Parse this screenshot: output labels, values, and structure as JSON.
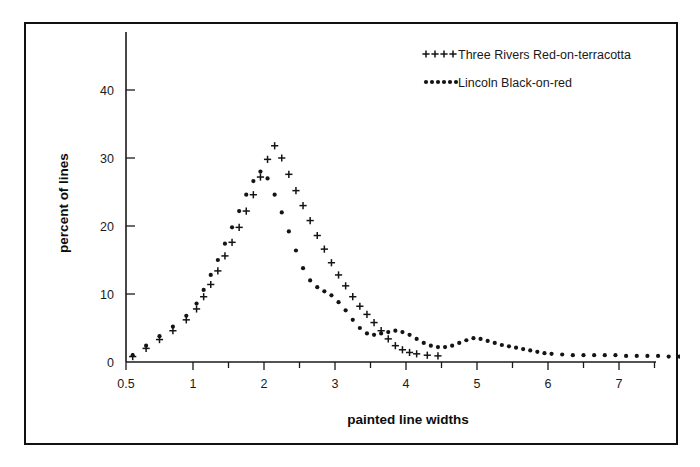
{
  "figure": {
    "border_color": "#111111",
    "background": "#ffffff"
  },
  "chart_data": {
    "type": "line",
    "title": "",
    "xlabel": "painted line widths",
    "ylabel": "percent of lines",
    "xlim": [
      0.4,
      8.25
    ],
    "ylim": [
      0,
      45
    ],
    "grid": false,
    "legend_position": "top-right",
    "x_ticks_major": [
      0.5,
      1,
      2,
      3,
      4,
      5,
      6,
      7,
      8
    ],
    "x_tick_labels": [
      "0.5",
      "1",
      "2",
      "3",
      "4",
      "5",
      "6",
      "7",
      "8"
    ],
    "x_ticks_minor": [
      1.5,
      2.5,
      3.5,
      4.5,
      5.5,
      6.5,
      7.5
    ],
    "y_ticks_major": [
      0,
      10,
      20,
      30,
      40
    ],
    "y_tick_labels": [
      "0",
      "10",
      "20",
      "30",
      "40"
    ],
    "series": [
      {
        "name": "Three Rivers Red-on-terracotta",
        "marker": "plus",
        "marker_color": "#141414",
        "x": [
          0.55,
          0.65,
          0.75,
          0.85,
          0.95,
          1.05,
          1.15,
          1.25,
          1.35,
          1.45,
          1.55,
          1.65,
          1.75,
          1.85,
          1.95,
          2.05,
          2.15,
          2.25,
          2.35,
          2.45,
          2.55,
          2.65,
          2.75,
          2.85,
          2.95,
          3.05,
          3.15,
          3.25,
          3.35,
          3.45,
          3.55,
          3.65,
          3.75,
          3.85,
          3.95,
          4.05,
          4.15,
          4.3,
          4.45
        ],
        "y": [
          0.8,
          2.0,
          3.3,
          4.6,
          6.2,
          7.8,
          9.6,
          11.4,
          13.4,
          15.6,
          17.6,
          19.8,
          22.2,
          24.6,
          27.2,
          29.8,
          31.8,
          30.0,
          27.6,
          25.2,
          23.0,
          20.8,
          18.6,
          16.6,
          14.6,
          12.8,
          11.2,
          9.6,
          8.2,
          7.0,
          5.8,
          4.6,
          3.4,
          2.4,
          1.8,
          1.4,
          1.2,
          1.0,
          0.9
        ]
      },
      {
        "name": "Lincoln Black-on-red",
        "marker": "dot",
        "marker_color": "#141414",
        "x": [
          0.55,
          0.65,
          0.75,
          0.85,
          0.95,
          1.05,
          1.15,
          1.25,
          1.35,
          1.45,
          1.55,
          1.65,
          1.75,
          1.85,
          1.95,
          2.05,
          2.15,
          2.25,
          2.35,
          2.45,
          2.55,
          2.65,
          2.75,
          2.85,
          2.95,
          3.05,
          3.15,
          3.25,
          3.35,
          3.45,
          3.55,
          3.65,
          3.75,
          3.85,
          3.95,
          4.05,
          4.15,
          4.25,
          4.35,
          4.45,
          4.55,
          4.65,
          4.75,
          4.85,
          4.95,
          5.05,
          5.15,
          5.25,
          5.35,
          5.45,
          5.55,
          5.65,
          5.75,
          5.85,
          5.95,
          6.05,
          6.2,
          6.35,
          6.5,
          6.65,
          6.8,
          6.95,
          7.1,
          7.25,
          7.4,
          7.55,
          7.7,
          7.85,
          8.0
        ],
        "y": [
          1.0,
          2.4,
          3.8,
          5.2,
          6.8,
          8.6,
          10.6,
          12.8,
          15.0,
          17.4,
          19.8,
          22.2,
          24.6,
          26.6,
          28.0,
          27.0,
          24.6,
          22.0,
          19.2,
          16.4,
          13.8,
          12.0,
          11.0,
          10.4,
          9.8,
          8.8,
          7.6,
          6.2,
          5.0,
          4.2,
          4.0,
          4.2,
          4.4,
          4.6,
          4.4,
          4.0,
          3.4,
          2.8,
          2.4,
          2.2,
          2.2,
          2.4,
          2.8,
          3.2,
          3.5,
          3.4,
          3.1,
          2.8,
          2.5,
          2.3,
          2.1,
          1.9,
          1.7,
          1.5,
          1.3,
          1.2,
          1.1,
          1.0,
          1.0,
          1.0,
          1.0,
          1.0,
          0.9,
          0.9,
          0.9,
          0.9,
          0.8,
          0.8,
          0.8
        ]
      }
    ]
  },
  "legend": {
    "entries": [
      {
        "label": "Three Rivers Red-on-terracotta",
        "marker": "plus"
      },
      {
        "label": "Lincoln Black-on-red",
        "marker": "dot"
      }
    ]
  }
}
